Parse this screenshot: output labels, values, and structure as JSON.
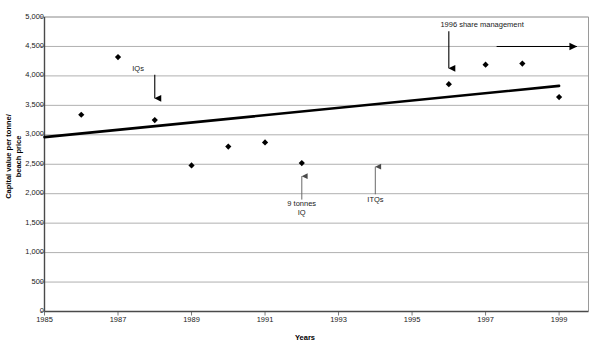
{
  "chart_data": {
    "type": "scatter",
    "title": "",
    "xlabel": "Years",
    "ylabel_line1": "Capital value per tonne/",
    "ylabel_line2": "beach price",
    "xlim": [
      1985,
      1999.8
    ],
    "ylim": [
      0,
      5000
    ],
    "grid": true,
    "legend": "none",
    "y_ticks": [
      "5,000",
      "4,500",
      "4,000",
      "3,500",
      "3,000",
      "2,500",
      "2,000",
      "1,500",
      "1,000",
      "500",
      "0"
    ],
    "y_tick_values": [
      5000,
      4500,
      4000,
      3500,
      3000,
      2500,
      2000,
      1500,
      1000,
      500,
      0
    ],
    "x_ticks": [
      "1985",
      "1987",
      "1989",
      "1991",
      "1993",
      "1995",
      "1997",
      "1999"
    ],
    "x_tick_values": [
      1985,
      1987,
      1989,
      1991,
      1993,
      1995,
      1997,
      1999
    ],
    "series": [
      {
        "name": "Capital value per tonne / beach price",
        "marker": "diamond",
        "color": "#000000",
        "x": [
          1986,
          1987,
          1988,
          1989,
          1990,
          1991,
          1992,
          1996,
          1997,
          1998,
          1999
        ],
        "values": [
          3340,
          4320,
          3250,
          2480,
          2800,
          2870,
          2520,
          3860,
          4190,
          4210,
          3640
        ]
      },
      {
        "name": "Trend line",
        "marker": "none",
        "type": "line",
        "color": "#000000",
        "x": [
          1985,
          1999
        ],
        "values": [
          2960,
          3830
        ]
      }
    ],
    "annotations": [
      {
        "id": "iqs",
        "label": "IQs",
        "label_x": 1987.55,
        "label_y": 4120,
        "arrow": "down",
        "arrow_x": 1988,
        "arrow_from_y": 4020,
        "arrow_to_y": 3500
      },
      {
        "id": "nine-tonnes-iq",
        "label_line1": "9 tonnes",
        "label_line2": "IQ",
        "label_x": 1992,
        "label_y": 1820,
        "arrow": "up",
        "arrow_x": 1992,
        "arrow_from_y": 1900,
        "arrow_to_y": 2400
      },
      {
        "id": "itqs",
        "label": "ITQs",
        "label_x": 1994,
        "label_y": 1900,
        "arrow": "up",
        "arrow_x": 1994,
        "arrow_from_y": 1990,
        "arrow_to_y": 2560
      },
      {
        "id": "share-management",
        "label": "1996 share management",
        "label_x": 1996.9,
        "label_y": 4860,
        "arrow": "down",
        "arrow_x": 1996,
        "arrow_from_y": 4760,
        "arrow_to_y": 4010,
        "extra_arrow": "right",
        "extra_from_x": 1997.3,
        "extra_to_x": 1999.7,
        "extra_y": 4500
      }
    ]
  }
}
